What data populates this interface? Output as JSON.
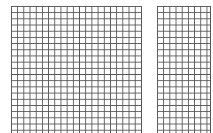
{
  "grids": [
    {
      "name": "left-grid",
      "x": 11,
      "y": 6,
      "width": 131,
      "height": 127,
      "cell": 6.2,
      "line_color": "#555555"
    },
    {
      "name": "right-grid",
      "x": 157,
      "y": 6,
      "width": 54,
      "height": 127,
      "cell": 6.2,
      "line_color": "#555555"
    }
  ]
}
